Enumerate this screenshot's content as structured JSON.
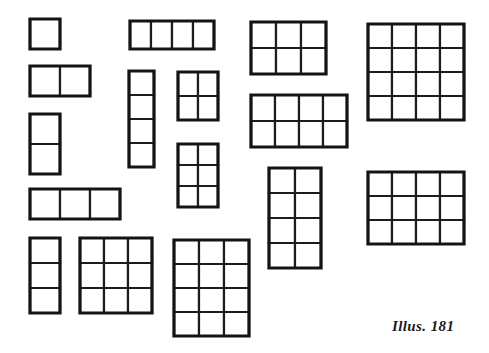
{
  "page": {
    "width": 489,
    "height": 353,
    "background_color": "#ffffff",
    "line_color": "#1c1c1c",
    "title": "Illus. 181"
  },
  "caption": {
    "text": "Illus. 181",
    "x": 392,
    "y": 318
  },
  "figures": [
    {
      "name": "grid-1x1",
      "cols": 1,
      "rows": 1,
      "x": 28,
      "y": 17,
      "cell_w": 30,
      "cell_h": 30,
      "cells": 1,
      "label": "1 by 1"
    },
    {
      "name": "grid-2x1",
      "cols": 2,
      "rows": 1,
      "x": 28,
      "y": 64,
      "cell_w": 30,
      "cell_h": 30,
      "cells": 2,
      "label": "2 by 1"
    },
    {
      "name": "grid-1x2",
      "cols": 1,
      "rows": 2,
      "x": 28,
      "y": 112,
      "cell_w": 30,
      "cell_h": 30,
      "cells": 2,
      "label": "1 by 2"
    },
    {
      "name": "grid-3x1",
      "cols": 3,
      "rows": 1,
      "x": 28,
      "y": 187,
      "cell_w": 30,
      "cell_h": 30,
      "cells": 3,
      "label": "3 by 1"
    },
    {
      "name": "grid-1x3",
      "cols": 1,
      "rows": 3,
      "x": 28,
      "y": 236,
      "cell_w": 30,
      "cell_h": 25,
      "cells": 3,
      "label": "1 by 3"
    },
    {
      "name": "grid-3x3",
      "cols": 3,
      "rows": 3,
      "x": 78,
      "y": 236,
      "cell_w": 24,
      "cell_h": 25,
      "cells": 9,
      "label": "3 by 3"
    },
    {
      "name": "grid-4x1",
      "cols": 4,
      "rows": 1,
      "x": 128,
      "y": 19,
      "cell_w": 21,
      "cell_h": 28,
      "cells": 4,
      "label": "4 by 1"
    },
    {
      "name": "grid-1x4",
      "cols": 1,
      "rows": 4,
      "x": 127,
      "y": 69,
      "cell_w": 25,
      "cell_h": 24,
      "cells": 4,
      "label": "1 by 4"
    },
    {
      "name": "grid-2x2",
      "cols": 2,
      "rows": 2,
      "x": 176,
      "y": 70,
      "cell_w": 20,
      "cell_h": 24,
      "cells": 4,
      "label": "2 by 2"
    },
    {
      "name": "grid-2x3",
      "cols": 2,
      "rows": 3,
      "x": 176,
      "y": 142,
      "cell_w": 20,
      "cell_h": 21,
      "cells": 6,
      "label": "2 by 3"
    },
    {
      "name": "grid-3x4",
      "cols": 3,
      "rows": 4,
      "x": 172,
      "y": 238,
      "cell_w": 25,
      "cell_h": 24,
      "cells": 12,
      "label": "3 by 4"
    },
    {
      "name": "grid-3x2",
      "cols": 3,
      "rows": 2,
      "x": 249,
      "y": 20,
      "cell_w": 25,
      "cell_h": 26,
      "cells": 6,
      "label": "3 by 2"
    },
    {
      "name": "grid-4x2",
      "cols": 4,
      "rows": 2,
      "x": 249,
      "y": 93,
      "cell_w": 24,
      "cell_h": 26,
      "cells": 8,
      "label": "4 by 2"
    },
    {
      "name": "grid-2x4",
      "cols": 2,
      "rows": 4,
      "x": 267,
      "y": 166,
      "cell_w": 26,
      "cell_h": 25,
      "cells": 8,
      "label": "2 by 4"
    },
    {
      "name": "grid-4x4",
      "cols": 4,
      "rows": 4,
      "x": 366,
      "y": 22,
      "cell_w": 24,
      "cell_h": 24,
      "cells": 16,
      "label": "4 by 4"
    },
    {
      "name": "grid-4x3",
      "cols": 4,
      "rows": 3,
      "x": 366,
      "y": 170,
      "cell_w": 24,
      "cell_h": 24,
      "cells": 12,
      "label": "4 by 3"
    }
  ]
}
